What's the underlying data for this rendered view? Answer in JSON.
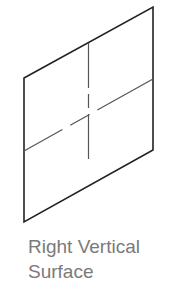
{
  "diagram": {
    "type": "isometric-surface",
    "outline_color": "#222222",
    "centerline_color": "#555555",
    "shape": {
      "name": "right-vertical-surface",
      "corners": {
        "top_left": [
          24,
          78
        ],
        "top_right": [
          153,
          7
        ],
        "bottom_right": [
          153,
          150
        ],
        "bottom_left": [
          24,
          222
        ]
      }
    }
  },
  "caption": {
    "line1": "Right Vertical",
    "line2": "Surface"
  }
}
